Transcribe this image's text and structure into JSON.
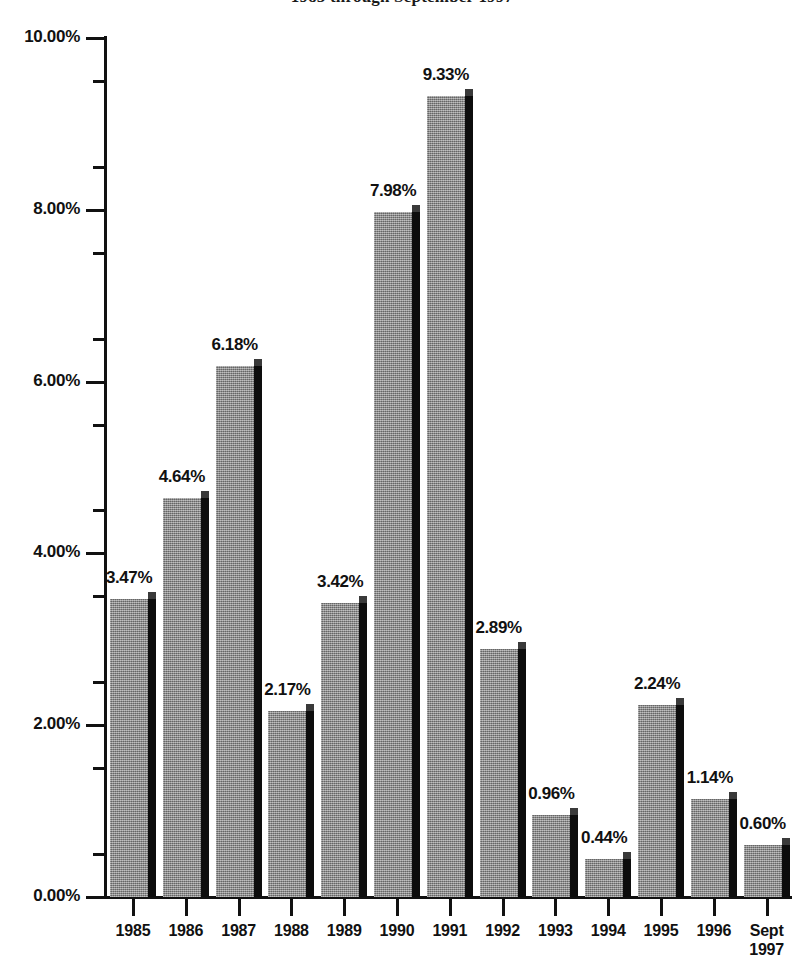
{
  "chart_data": {
    "type": "bar",
    "title": "1985 through September 1997",
    "xlabel": "",
    "ylabel": "",
    "ylim": [
      0,
      10
    ],
    "ytick_labels": [
      "0.00%",
      "2.00%",
      "4.00%",
      "6.00%",
      "8.00%",
      "10.00%"
    ],
    "ytick_values": [
      0,
      2,
      4,
      6,
      8,
      10
    ],
    "minor_tick_interval": 0.5,
    "grid": false,
    "legend": null,
    "value_label_suffix": "%",
    "categories": [
      "1985",
      "1986",
      "1987",
      "1988",
      "1989",
      "1990",
      "1991",
      "1992",
      "1993",
      "1994",
      "1995",
      "1996",
      "Sept\n1997"
    ],
    "values": [
      3.47,
      4.64,
      6.18,
      2.17,
      3.42,
      7.98,
      9.33,
      2.89,
      0.96,
      0.44,
      2.24,
      1.14,
      0.6
    ],
    "data_labels": [
      "3.47%",
      "4.64%",
      "6.18%",
      "2.17%",
      "3.42%",
      "7.98%",
      "9.33%",
      "2.89%",
      "0.96%",
      "0.44%",
      "2.24%",
      "1.14%",
      "0.60%"
    ],
    "colors": {
      "bar_face": "#8a8a8a",
      "bar_side": "#0d0d0d",
      "bar_top": "#3a3a3a",
      "axis": "#111111",
      "background": "#ffffff",
      "text": "#111111"
    }
  }
}
